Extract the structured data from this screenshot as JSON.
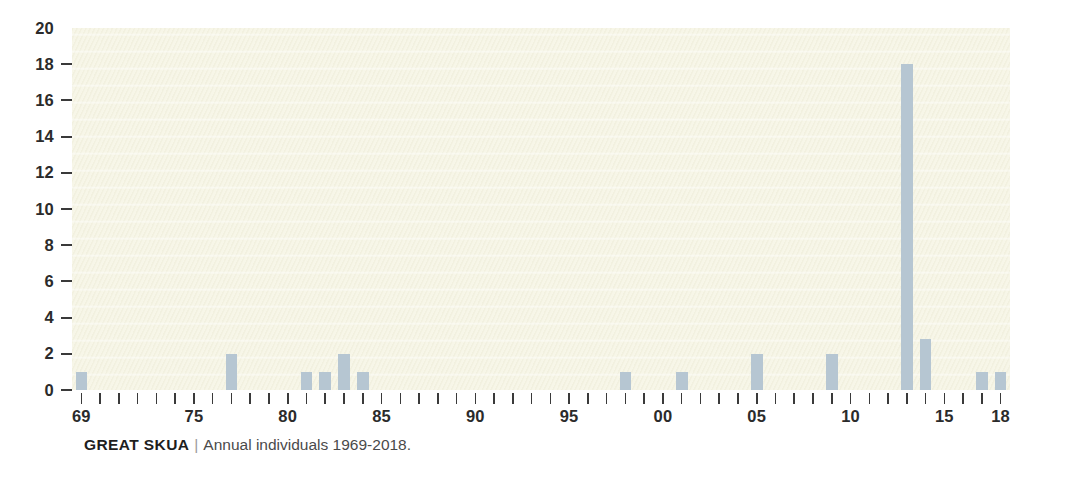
{
  "caption": {
    "species": "GREAT SKUA",
    "separator": "|",
    "description": "Annual individuals 1969-2018."
  },
  "colors": {
    "bar": "#b6c6d2",
    "plot_background": "#f7f6e8",
    "axis_text": "#2b2b2b",
    "page_background": "#ffffff"
  },
  "chart_data": {
    "type": "bar",
    "title": "GREAT SKUA",
    "subtitle": "Annual individuals 1969-2018.",
    "xlabel": "",
    "ylabel": "",
    "ylim": [
      0,
      20
    ],
    "y_ticks": [
      0,
      2,
      4,
      6,
      8,
      10,
      12,
      14,
      16,
      18,
      20
    ],
    "y_tick_labels": [
      "0",
      "2",
      "4",
      "6",
      "8",
      "10",
      "12",
      "14",
      "16",
      "18",
      "20"
    ],
    "grid": false,
    "legend": "none",
    "x_range": [
      1969,
      2018
    ],
    "x_labeled_ticks": [
      {
        "year": 1969,
        "label": "69"
      },
      {
        "year": 1975,
        "label": "75"
      },
      {
        "year": 1980,
        "label": "80"
      },
      {
        "year": 1985,
        "label": "85"
      },
      {
        "year": 1990,
        "label": "90"
      },
      {
        "year": 1995,
        "label": "95"
      },
      {
        "year": 2000,
        "label": "00"
      },
      {
        "year": 2005,
        "label": "05"
      },
      {
        "year": 2010,
        "label": "10"
      },
      {
        "year": 2015,
        "label": "15"
      },
      {
        "year": 2018,
        "label": "18"
      }
    ],
    "categories": [
      1969,
      1970,
      1971,
      1972,
      1973,
      1974,
      1975,
      1976,
      1977,
      1978,
      1979,
      1980,
      1981,
      1982,
      1983,
      1984,
      1985,
      1986,
      1987,
      1988,
      1989,
      1990,
      1991,
      1992,
      1993,
      1994,
      1995,
      1996,
      1997,
      1998,
      1999,
      2000,
      2001,
      2002,
      2003,
      2004,
      2005,
      2006,
      2007,
      2008,
      2009,
      2010,
      2011,
      2012,
      2013,
      2014,
      2015,
      2016,
      2017,
      2018
    ],
    "values": [
      1,
      0,
      0,
      0,
      0,
      0,
      0,
      0,
      2,
      0,
      0,
      0,
      1,
      1,
      2,
      1,
      0,
      0,
      0,
      0,
      0,
      0,
      0,
      0,
      0,
      0,
      0,
      0,
      0,
      1,
      0,
      0,
      1,
      0,
      0,
      0,
      2,
      0,
      0,
      0,
      2,
      0,
      0,
      0,
      18,
      2.8,
      0,
      0,
      1,
      1
    ]
  }
}
